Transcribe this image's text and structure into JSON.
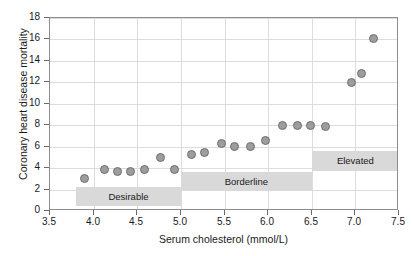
{
  "chart_data": {
    "type": "scatter",
    "title": "",
    "xlabel": "Serum cholesterol (mmol/L)",
    "ylabel": "Coronary heart disease mortality",
    "xlim": [
      3.5,
      7.5
    ],
    "ylim": [
      0,
      18
    ],
    "xticks": [
      "3.5",
      "4.0",
      "4.5",
      "5.0",
      "5.5",
      "6.0",
      "6.5",
      "7.0",
      "7.5"
    ],
    "xtick_values": [
      3.5,
      4.0,
      4.5,
      5.0,
      5.5,
      6.0,
      6.5,
      7.0,
      7.5
    ],
    "yticks": [
      "0",
      "2",
      "4",
      "6",
      "8",
      "10",
      "12",
      "14",
      "16",
      "18"
    ],
    "ytick_values": [
      0,
      2,
      4,
      6,
      8,
      10,
      12,
      14,
      16,
      18
    ],
    "grid": true,
    "legend": "none",
    "marker_color": "#9d9d9d",
    "marker_edge_color": "#6f6f6f",
    "band_color": "#d9d9d9",
    "grid_color": "#dcdcdc",
    "axis_color": "#8d8d8d",
    "points": [
      {
        "x": 3.9,
        "y": 3.0
      },
      {
        "x": 4.12,
        "y": 3.9
      },
      {
        "x": 4.27,
        "y": 3.7
      },
      {
        "x": 4.42,
        "y": 3.7
      },
      {
        "x": 4.58,
        "y": 3.9
      },
      {
        "x": 4.77,
        "y": 5.0
      },
      {
        "x": 4.93,
        "y": 3.9
      },
      {
        "x": 5.12,
        "y": 5.3
      },
      {
        "x": 5.27,
        "y": 5.5
      },
      {
        "x": 5.46,
        "y": 6.3
      },
      {
        "x": 5.62,
        "y": 6.0
      },
      {
        "x": 5.8,
        "y": 6.0
      },
      {
        "x": 5.97,
        "y": 6.6
      },
      {
        "x": 6.16,
        "y": 8.0
      },
      {
        "x": 6.34,
        "y": 8.0
      },
      {
        "x": 6.49,
        "y": 8.0
      },
      {
        "x": 6.66,
        "y": 7.9
      },
      {
        "x": 6.96,
        "y": 12.0
      },
      {
        "x": 7.07,
        "y": 12.8
      },
      {
        "x": 7.21,
        "y": 16.1
      }
    ],
    "annotations": [
      {
        "label": "Desirable",
        "x_start": 3.8,
        "x_end": 5.0,
        "y_bottom": 0.45,
        "y_top": 2.25
      },
      {
        "label": "Borderline",
        "x_start": 5.0,
        "x_end": 6.5,
        "y_bottom": 1.85,
        "y_top": 3.6
      },
      {
        "label": "Elevated",
        "x_start": 6.5,
        "x_end": 7.5,
        "y_bottom": 3.75,
        "y_top": 5.6
      }
    ]
  }
}
